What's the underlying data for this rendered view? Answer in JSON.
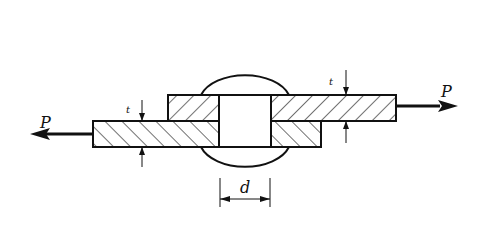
{
  "diagram": {
    "labels": {
      "force_left": "P",
      "force_right": "P",
      "thickness_left": "t",
      "thickness_right": "t",
      "diameter": "d"
    },
    "colors": {
      "stroke": "#111111",
      "background": "#ffffff"
    }
  }
}
